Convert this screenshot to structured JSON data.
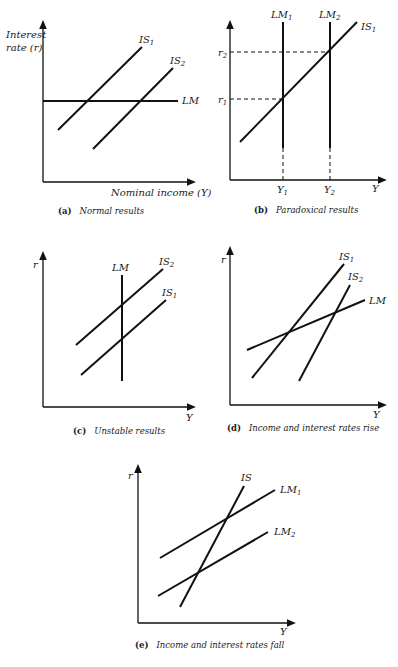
{
  "figure": {
    "panels": [
      {
        "id": "a",
        "caption_letter": "(a)",
        "caption": "Normal results",
        "y_label_line1": "Interest",
        "y_label_line2": "rate (r)",
        "x_label": "Nominal income (Y)",
        "curves": [
          {
            "name": "IS",
            "sub": "1"
          },
          {
            "name": "IS",
            "sub": "2"
          },
          {
            "name": "LM",
            "sub": ""
          }
        ]
      },
      {
        "id": "b",
        "caption_letter": "(b)",
        "caption": "Paradoxical results",
        "x_label": "Y",
        "ticks_y": [
          {
            "name": "r",
            "sub": "2"
          },
          {
            "name": "r",
            "sub": "1"
          }
        ],
        "ticks_x": [
          {
            "name": "Y",
            "sub": "1"
          },
          {
            "name": "Y",
            "sub": "2"
          }
        ],
        "curves": [
          {
            "name": "LM",
            "sub": "1"
          },
          {
            "name": "LM",
            "sub": "2"
          },
          {
            "name": "IS",
            "sub": "1"
          }
        ]
      },
      {
        "id": "c",
        "caption_letter": "(c)",
        "caption": "Unstable results",
        "y_label": "r",
        "x_label": "Y",
        "curves": [
          {
            "name": "LM",
            "sub": ""
          },
          {
            "name": "IS",
            "sub": "2"
          },
          {
            "name": "IS",
            "sub": "1"
          }
        ]
      },
      {
        "id": "d",
        "caption_letter": "(d)",
        "caption": "Income and interest rates rise",
        "y_label": "r",
        "x_label": "Y",
        "curves": [
          {
            "name": "IS",
            "sub": "1"
          },
          {
            "name": "IS",
            "sub": "2"
          },
          {
            "name": "LM",
            "sub": ""
          }
        ]
      },
      {
        "id": "e",
        "caption_letter": "(e)",
        "caption": "Income and interest rates fall",
        "y_label": "r",
        "x_label": "Y",
        "curves": [
          {
            "name": "IS",
            "sub": ""
          },
          {
            "name": "LM",
            "sub": "1"
          },
          {
            "name": "LM",
            "sub": "2"
          }
        ]
      }
    ]
  }
}
